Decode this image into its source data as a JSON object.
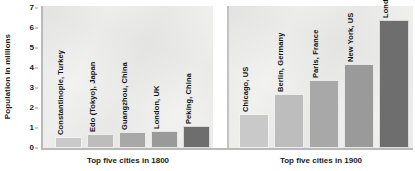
{
  "chart_data": {
    "type": "bar",
    "title": "",
    "xlabel": "",
    "ylabel": "Population in millions",
    "ylim": [
      0,
      7
    ],
    "yticks": [
      0,
      1,
      2,
      3,
      4,
      5,
      6,
      7
    ],
    "grid": false,
    "legend": false,
    "panels": [
      {
        "caption": "Top five cities in 1800",
        "categories": [
          "Constantinople, Turkey",
          "Edo (Tokyo), Japan",
          "Guangzhou, China",
          "London, UK",
          "Peking, China"
        ],
        "values": [
          0.55,
          0.68,
          0.8,
          0.87,
          1.1
        ],
        "colors": [
          "#c9c9c9",
          "#bdbdbd",
          "#a8a8a8",
          "#9a9a9a",
          "#6e6e6e"
        ]
      },
      {
        "caption": "Top five cities in 1900",
        "categories": [
          "Chicago, US",
          "Berlin, Germany",
          "Paris, France",
          "New York, US",
          "London, UK"
        ],
        "values": [
          1.7,
          2.7,
          3.4,
          4.2,
          6.4
        ],
        "colors": [
          "#c9c9c9",
          "#bdbdbd",
          "#a8a8a8",
          "#9a9a9a",
          "#6e6e6e"
        ]
      }
    ]
  },
  "axis": {
    "y_title": "Population in millions",
    "tick_labels": [
      "7",
      "6",
      "5",
      "4",
      "3",
      "2",
      "1",
      "0"
    ]
  },
  "captions": {
    "left": "Top five cities in 1800",
    "right": "Top five cities in 1900"
  },
  "bars_1800": [
    {
      "label": "Constantinople, Turkey",
      "value": 0.55,
      "color": "#c9c9c9"
    },
    {
      "label": "Edo (Tokyo), Japan",
      "value": 0.68,
      "color": "#bdbdbd"
    },
    {
      "label": "Guangzhou, China",
      "value": 0.8,
      "color": "#a8a8a8"
    },
    {
      "label": "London, UK",
      "value": 0.87,
      "color": "#9a9a9a"
    },
    {
      "label": "Peking, China",
      "value": 1.1,
      "color": "#6e6e6e"
    }
  ],
  "bars_1900": [
    {
      "label": "Chicago, US",
      "value": 1.7,
      "color": "#c9c9c9"
    },
    {
      "label": "Berlin, Germany",
      "value": 2.7,
      "color": "#bdbdbd"
    },
    {
      "label": "Paris, France",
      "value": 3.4,
      "color": "#a8a8a8"
    },
    {
      "label": "New York, US",
      "value": 4.2,
      "color": "#9a9a9a"
    },
    {
      "label": "London, UK",
      "value": 6.4,
      "color": "#6e6e6e"
    }
  ]
}
